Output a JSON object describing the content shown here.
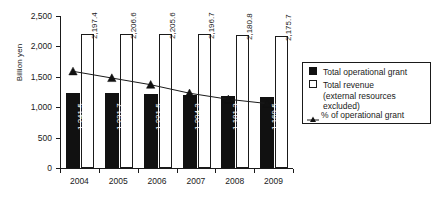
{
  "chart_data": {
    "type": "bar",
    "title": "",
    "subtitle": "",
    "xlabel": "",
    "ylabel": "Billion yen",
    "ylim": [
      0,
      2500
    ],
    "ytick_labels": [
      "0",
      "500",
      "1,000",
      "1,500",
      "2,000",
      "2,500"
    ],
    "ytick_values": [
      0,
      500,
      1000,
      1500,
      2000,
      2500
    ],
    "grid": false,
    "legend_position": "right",
    "categories": [
      "2004",
      "2005",
      "2006",
      "2007",
      "2008",
      "2009"
    ],
    "series": [
      {
        "name": "Total operational grant",
        "type": "bar",
        "style": "filled-black",
        "values": [
          1241.5,
          1231.7,
          1221.5,
          1204.3,
          1181.3,
          1169.5
        ],
        "labels": [
          "1,241.5",
          "1,231.7",
          "1,221.5",
          "1,204.3",
          "1,181.3",
          "1,169.5"
        ]
      },
      {
        "name": "Total revenue (external resources excluded)",
        "type": "bar",
        "style": "hollow-white",
        "values": [
          2197.4,
          2206.6,
          2205.6,
          2196.7,
          2180.8,
          2175.7
        ],
        "labels": [
          "2,197.4",
          "2,206.6",
          "2,205.6",
          "2,196.7",
          "2,180.8",
          "2,175.7"
        ]
      },
      {
        "name": "% of operational grant",
        "type": "line",
        "marker": "triangle",
        "values": [
          1590,
          1480,
          1370,
          1230,
          1130,
          1060
        ],
        "labels": [
          "",
          "",
          "",
          "",
          "",
          ""
        ]
      }
    ]
  },
  "legend": {
    "items": [
      {
        "marker": "filled-square",
        "label_line1": "Total operational grant",
        "label_line2": "",
        "label_line3": ""
      },
      {
        "marker": "hollow-square",
        "label_line1": "Total revenue",
        "label_line2": "(external resources",
        "label_line3": "excluded)"
      },
      {
        "marker": "triangle-line",
        "label_line1": "% of operational grant",
        "label_line2": "",
        "label_line3": ""
      }
    ]
  }
}
